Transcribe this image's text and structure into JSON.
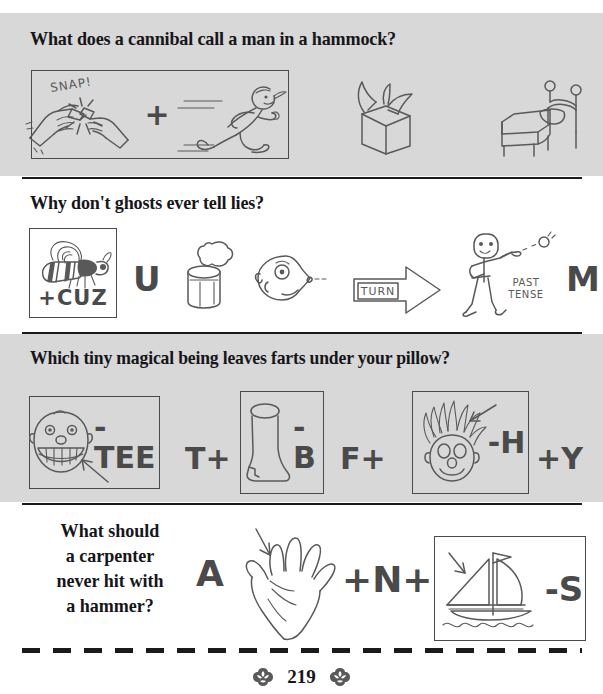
{
  "page": {
    "folio_number": "219",
    "left_ornament": "floral-ornament-icon",
    "right_ornament": "floral-ornament-icon",
    "background_color": "#ffffff",
    "band_color": "#d8d8d8",
    "ink_color": "#595959",
    "text_color": "#16161a"
  },
  "puzzles": [
    {
      "id": "puzzle-1",
      "band": "gray",
      "question": "What does a cannibal call a man in a hammock?",
      "elements": [
        {
          "kind": "framed-group",
          "items": [
            {
              "kind": "icon",
              "name": "hands-snapping-stick-icon",
              "caption": "SNAP!"
            },
            {
              "kind": "operator",
              "text": "+"
            },
            {
              "kind": "icon",
              "name": "running-person-icon"
            }
          ]
        },
        {
          "kind": "icon",
          "name": "open-box-icon"
        },
        {
          "kind": "icon",
          "name": "bed-icon"
        }
      ]
    },
    {
      "id": "puzzle-2",
      "band": "white",
      "question": "Why don't ghosts ever tell lies?",
      "elements": [
        {
          "kind": "framed",
          "items": [
            {
              "kind": "icon",
              "name": "bee-icon"
            },
            {
              "kind": "letters",
              "text": "+CUZ"
            }
          ]
        },
        {
          "kind": "letters",
          "text": "U"
        },
        {
          "kind": "icon",
          "name": "can-popping-icon"
        },
        {
          "kind": "icon",
          "name": "face-blowing-icon"
        },
        {
          "kind": "icon",
          "name": "turn-arrow-icon",
          "caption": "TURN"
        },
        {
          "kind": "icon",
          "name": "person-throwing-icon",
          "caption": "PAST TENSE"
        },
        {
          "kind": "letters",
          "text": "M"
        }
      ]
    },
    {
      "id": "puzzle-3",
      "band": "gray",
      "question": "Which tiny magical being leaves farts under your pillow?",
      "elements": [
        {
          "kind": "framed",
          "items": [
            {
              "kind": "icon",
              "name": "grinning-face-teeth-icon"
            },
            {
              "kind": "letters",
              "text": "-TEE"
            }
          ]
        },
        {
          "kind": "letters",
          "text": "T+"
        },
        {
          "kind": "framed",
          "items": [
            {
              "kind": "icon",
              "name": "boot-icon"
            },
            {
              "kind": "letters",
              "text": "-B"
            }
          ]
        },
        {
          "kind": "letters",
          "text": "F+"
        },
        {
          "kind": "framed",
          "items": [
            {
              "kind": "icon",
              "name": "spiky-hair-face-icon"
            },
            {
              "kind": "letters",
              "text": "-H"
            }
          ]
        },
        {
          "kind": "letters",
          "text": "+Y"
        }
      ]
    },
    {
      "id": "puzzle-4",
      "band": "white",
      "question_lines": [
        "What should",
        "a carpenter",
        "never hit with",
        "a hammer?"
      ],
      "elements": [
        {
          "kind": "letters",
          "text": "A"
        },
        {
          "kind": "icon",
          "name": "hand-icon"
        },
        {
          "kind": "letters",
          "text": "+N+"
        },
        {
          "kind": "framed",
          "items": [
            {
              "kind": "icon",
              "name": "sailboat-icon"
            },
            {
              "kind": "letters",
              "text": "-S"
            }
          ]
        }
      ]
    }
  ],
  "labels": {
    "snap": "SNAP!",
    "cuz": "+CUZ",
    "u": "U",
    "turn": "TURN",
    "past": "PAST",
    "tense": "TENSE",
    "m": "M",
    "tee": "-TEE",
    "t_plus": "T+",
    "minus_b": "-B",
    "f_plus": "F+",
    "minus_h": "-H",
    "plus_y": "+Y",
    "a": "A",
    "plus_n_plus": "+N+",
    "minus_s": "-S",
    "plus": "+"
  }
}
